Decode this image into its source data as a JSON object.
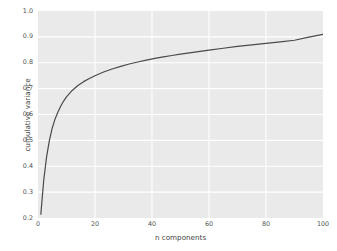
{
  "chart_data": {
    "type": "line",
    "title": "",
    "xlabel": "n components",
    "ylabel": "cumulative variance",
    "xlim": [
      0,
      100
    ],
    "ylim": [
      0.2,
      1.0
    ],
    "xticks": [
      "0",
      "20",
      "40",
      "60",
      "80",
      "100"
    ],
    "xtick_values": [
      0,
      20,
      40,
      60,
      80,
      100
    ],
    "yticks": [
      "0.2",
      "0.3",
      "0.4",
      "0.5",
      "0.6",
      "0.7",
      "0.8",
      "0.9",
      "1.0"
    ],
    "ytick_values": [
      0.2,
      0.3,
      0.4,
      0.5,
      0.6,
      0.7,
      0.8,
      0.9,
      1.0
    ],
    "grid": true,
    "legend": false,
    "line_color": "#4a4a4a",
    "line_width": 1.2,
    "panel_color": "#eaeaea",
    "grid_color": "#ffffff",
    "figure_color": "#ffffff",
    "tick_label_color": "#555555",
    "axis_label_color": "#444444",
    "series": [
      {
        "name": "cumulative variance",
        "x": [
          1,
          2,
          3,
          4,
          5,
          6,
          7,
          8,
          9,
          10,
          12,
          14,
          16,
          18,
          20,
          23,
          26,
          29,
          32,
          35,
          38,
          41,
          44,
          47,
          50,
          55,
          60,
          65,
          70,
          75,
          80,
          85,
          90,
          95,
          100
        ],
        "values": [
          0.215,
          0.345,
          0.435,
          0.5,
          0.548,
          0.583,
          0.61,
          0.633,
          0.652,
          0.668,
          0.693,
          0.712,
          0.727,
          0.739,
          0.75,
          0.764,
          0.776,
          0.786,
          0.795,
          0.803,
          0.81,
          0.817,
          0.823,
          0.828,
          0.833,
          0.841,
          0.849,
          0.856,
          0.863,
          0.869,
          0.875,
          0.881,
          0.887,
          0.899,
          0.91
        ]
      }
    ]
  }
}
